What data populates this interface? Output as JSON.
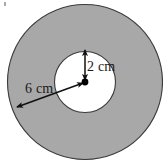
{
  "figure": {
    "background_color": "#ffffff",
    "outline_color": "#3a3a3a",
    "annotation_color": "#1a1a1a"
  },
  "shapes": {
    "outer_circle": {
      "name": "outer-circle",
      "fill_color": "#a8a8a8",
      "center_x": 85,
      "center_y": 82,
      "radius": 78
    },
    "inner_circle": {
      "name": "inner-circle",
      "fill_color": "#ffffff",
      "center_x": 85,
      "center_y": 82,
      "radius": 31
    },
    "center_dot": {
      "name": "center-dot",
      "fill_color": "#000000",
      "x": 85,
      "y": 82,
      "radius": 3.2
    }
  },
  "annotations": {
    "inner_radius": {
      "label": "2 cm",
      "value": 2,
      "unit": "cm",
      "arrow": "double-headed-vertical",
      "from_x": 85,
      "from_y": 82,
      "to_x": 85,
      "to_y": 51
    },
    "outer_radius": {
      "label": "6 cm",
      "value": 6,
      "unit": "cm",
      "arrow": "double-headed-diagonal",
      "from_x": 85,
      "from_y": 82,
      "to_x": 16,
      "to_y": 108
    }
  }
}
